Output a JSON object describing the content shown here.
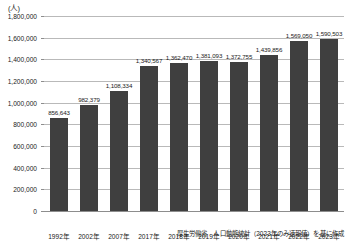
{
  "chart_data": {
    "type": "bar",
    "title": "",
    "subtitle": "",
    "unit_label": "(人)",
    "xlabel": "",
    "ylabel": "",
    "ylim": [
      0,
      1800000
    ],
    "ytick_step": 200000,
    "grid": true,
    "legend": null,
    "bar_color": "#3f3f3f",
    "categories": [
      "1992年",
      "2002年",
      "2007年",
      "2017年",
      "2018年",
      "2019年",
      "2020年",
      "2021年",
      "2022年",
      "2023年"
    ],
    "values": [
      856643,
      982379,
      1108334,
      1340567,
      1362470,
      1381093,
      1372755,
      1439856,
      1569050,
      1590503
    ],
    "value_labels": [
      "856,643",
      "982,379",
      "1,108,334",
      "1,340,567",
      "1,362,470",
      "1,381,093",
      "1,372,755",
      "1,439,856",
      "1,569,050",
      "1,590,503"
    ],
    "ytick_labels": [
      "0",
      "200,000",
      "400,000",
      "600,000",
      "800,000",
      "1,000,000",
      "1,200,000",
      "1,400,000",
      "1,600,000",
      "1,800,000"
    ],
    "ytick_values": [
      0,
      200000,
      400000,
      600000,
      800000,
      1000000,
      1200000,
      1400000,
      1600000,
      1800000
    ],
    "source_note": "厚生労働省　人口動態統計（2023年のみ速報値）を基に作成"
  }
}
